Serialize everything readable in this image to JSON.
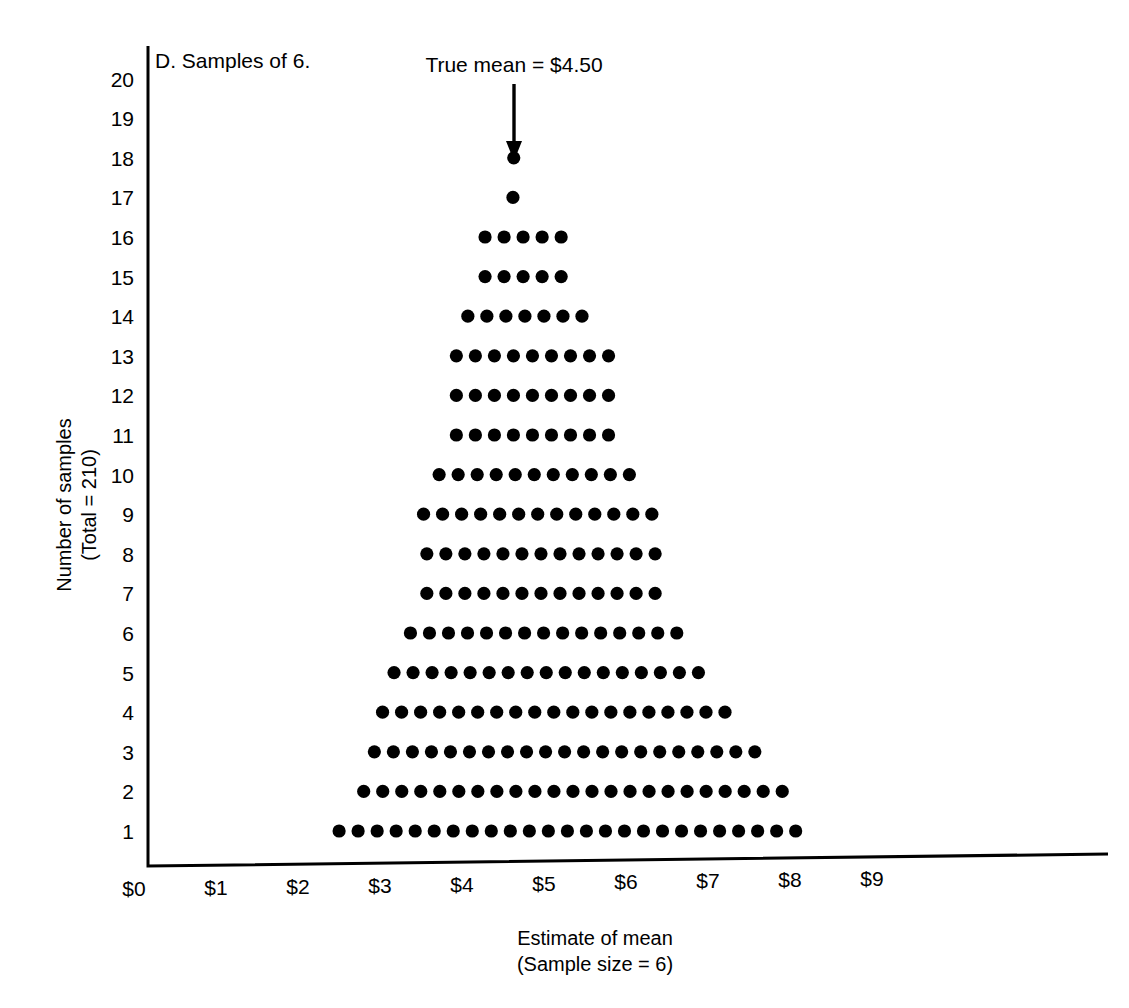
{
  "chart_data": {
    "type": "scatter",
    "title": "D. Samples of 6.",
    "xlabel": "Estimate of mean",
    "xlabel_sub": "(Sample size = 6)",
    "ylabel": "Number of samples",
    "ylabel_sub": "(Total = 210)",
    "xlim": [
      0,
      9.8
    ],
    "ylim": [
      0,
      20.8
    ],
    "grid": false,
    "legend": "none",
    "xticks": [
      "$0",
      "$1",
      "$2",
      "$3",
      "$4",
      "$5",
      "$6",
      "$7",
      "$8",
      "$9"
    ],
    "xtick_values": [
      0,
      1,
      2,
      3,
      4,
      5,
      6,
      7,
      8,
      9
    ],
    "yticks": [
      "1",
      "2",
      "3",
      "4",
      "5",
      "6",
      "7",
      "8",
      "9",
      "10",
      "11",
      "12",
      "13",
      "14",
      "15",
      "16",
      "17",
      "18",
      "19",
      "20"
    ],
    "ytick_values": [
      1,
      2,
      3,
      4,
      5,
      6,
      7,
      8,
      9,
      10,
      11,
      12,
      13,
      14,
      15,
      16,
      17,
      18,
      19,
      20
    ],
    "annotation": {
      "text": "True mean = $4.50",
      "x_value": 4.5,
      "arrow": "down-arrow"
    },
    "dot_plot_rows": [
      {
        "row": 1,
        "count": 25,
        "x_start": 2.55,
        "x_step": 0.232
      },
      {
        "row": 2,
        "count": 23,
        "x_start": 2.85,
        "x_step": 0.232
      },
      {
        "row": 3,
        "count": 21,
        "x_start": 2.98,
        "x_step": 0.232
      },
      {
        "row": 4,
        "count": 19,
        "x_start": 3.08,
        "x_step": 0.232
      },
      {
        "row": 5,
        "count": 17,
        "x_start": 3.22,
        "x_step": 0.232
      },
      {
        "row": 6,
        "count": 15,
        "x_start": 3.42,
        "x_step": 0.232
      },
      {
        "row": 7,
        "count": 13,
        "x_start": 3.62,
        "x_step": 0.232
      },
      {
        "row": 8,
        "count": 13,
        "x_start": 3.62,
        "x_step": 0.232
      },
      {
        "row": 9,
        "count": 13,
        "x_start": 3.58,
        "x_step": 0.232
      },
      {
        "row": 10,
        "count": 11,
        "x_start": 3.77,
        "x_step": 0.232
      },
      {
        "row": 11,
        "count": 9,
        "x_start": 3.98,
        "x_step": 0.232
      },
      {
        "row": 12,
        "count": 9,
        "x_start": 3.98,
        "x_step": 0.232
      },
      {
        "row": 13,
        "count": 9,
        "x_start": 3.98,
        "x_step": 0.232
      },
      {
        "row": 14,
        "count": 7,
        "x_start": 4.12,
        "x_step": 0.232
      },
      {
        "row": 15,
        "count": 5,
        "x_start": 4.33,
        "x_step": 0.232
      },
      {
        "row": 16,
        "count": 5,
        "x_start": 4.33,
        "x_step": 0.232
      },
      {
        "row": 17,
        "count": 1,
        "x_start": 4.67,
        "x_step": 0.232
      },
      {
        "row": 18,
        "count": 1,
        "x_start": 4.68,
        "x_step": 0.232
      }
    ],
    "total_samples": 210,
    "sample_size": 6,
    "true_mean": 4.5
  }
}
